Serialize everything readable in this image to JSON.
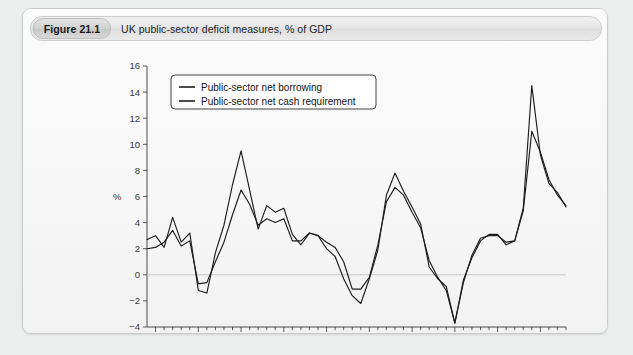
{
  "figure": {
    "tag": "Figure 21.1",
    "caption": "UK public-sector deficit measures, % of GDP"
  },
  "chart_data": {
    "type": "line",
    "title": "UK public-sector deficit measures, % of GDP",
    "xlabel": "",
    "ylabel": "%",
    "xlim": [
      1964,
      2013
    ],
    "ylim": [
      -4,
      16
    ],
    "ytick_step": 2,
    "yticks": [
      -4,
      -2,
      0,
      2,
      4,
      6,
      8,
      10,
      12,
      14,
      16
    ],
    "xticks_major": [
      1965,
      1970,
      1975,
      1980,
      1985,
      1990,
      1995,
      2000,
      2005,
      2010
    ],
    "xtick_minor_step": 1,
    "grid": false,
    "zero_line": true,
    "legend_position": "top-left",
    "x": [
      1964,
      1965,
      1966,
      1967,
      1968,
      1969,
      1970,
      1971,
      1972,
      1973,
      1974,
      1975,
      1976,
      1977,
      1978,
      1979,
      1980,
      1981,
      1982,
      1983,
      1984,
      1985,
      1986,
      1987,
      1988,
      1989,
      1990,
      1991,
      1992,
      1993,
      1994,
      1995,
      1996,
      1997,
      1998,
      1999,
      2000,
      2001,
      2002,
      2003,
      2004,
      2005,
      2006,
      2007,
      2008,
      2009,
      2010,
      2011,
      2012,
      2013
    ],
    "series": [
      {
        "name": "Public-sector net borrowing",
        "color": "#1d1d1d",
        "values": [
          2.0,
          2.1,
          2.5,
          3.4,
          2.2,
          2.6,
          -0.7,
          -0.6,
          1.0,
          2.5,
          4.6,
          6.5,
          5.4,
          3.8,
          4.3,
          4.0,
          4.3,
          2.6,
          2.6,
          3.2,
          3.0,
          2.5,
          2.1,
          1.0,
          -1.1,
          -1.1,
          -0.2,
          2.3,
          5.6,
          6.7,
          6.1,
          4.8,
          3.6,
          1.1,
          -0.2,
          -1.2,
          -3.7,
          -0.6,
          1.5,
          2.8,
          3.0,
          3.0,
          2.5,
          2.6,
          4.9,
          11.0,
          9.4,
          7.3,
          6.1,
          5.3
        ]
      },
      {
        "name": "Public-sector net cash requirement",
        "color": "#1d1d1d",
        "values": [
          2.7,
          3.0,
          2.1,
          4.4,
          2.5,
          3.2,
          -1.2,
          -1.4,
          1.7,
          3.8,
          6.9,
          9.5,
          6.5,
          3.5,
          5.3,
          4.8,
          5.1,
          3.1,
          2.3,
          3.2,
          3.0,
          2.0,
          1.4,
          -0.3,
          -1.6,
          -2.2,
          -0.3,
          1.9,
          6.1,
          7.8,
          6.4,
          5.2,
          3.9,
          0.6,
          -0.3,
          -0.9,
          -3.7,
          -0.4,
          1.3,
          2.6,
          3.1,
          3.1,
          2.3,
          2.6,
          5.1,
          14.5,
          9.2,
          7.0,
          6.3,
          5.2
        ]
      }
    ]
  },
  "legend": {
    "items": [
      {
        "label": "Public-sector net borrowing"
      },
      {
        "label": "Public-sector net cash requirement"
      }
    ]
  },
  "axis": {
    "y_label": "%",
    "y_ticks": [
      "16",
      "14",
      "12",
      "10",
      "8",
      "6",
      "4",
      "2",
      "0",
      "-2",
      "-4"
    ],
    "x_ticks": [
      "1965",
      "1970",
      "1975",
      "1980",
      "1985",
      "1990",
      "1995",
      "2000",
      "2005",
      "2010"
    ]
  }
}
